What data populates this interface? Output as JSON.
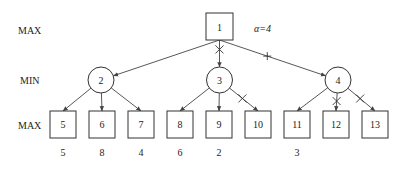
{
  "levels": [
    {
      "id": "level-max-top",
      "label": "MAX"
    },
    {
      "id": "level-min",
      "label": "MIN"
    },
    {
      "id": "level-max-bottom",
      "label": "MAX"
    }
  ],
  "root": {
    "id": "1",
    "label": "1",
    "annotation": "α=4",
    "shape": "square"
  },
  "min_nodes": [
    {
      "id": "2",
      "label": "2",
      "shape": "circle"
    },
    {
      "id": "3",
      "label": "3",
      "shape": "circle"
    },
    {
      "id": "4",
      "label": "4",
      "shape": "circle"
    }
  ],
  "leaves": [
    {
      "id": "5",
      "label": "5",
      "parent": "2",
      "value": "5"
    },
    {
      "id": "6",
      "label": "6",
      "parent": "2",
      "value": "8"
    },
    {
      "id": "7",
      "label": "7",
      "parent": "2",
      "value": "4"
    },
    {
      "id": "8",
      "label": "8",
      "parent": "3",
      "value": "6"
    },
    {
      "id": "9",
      "label": "9",
      "parent": "3",
      "value": "2"
    },
    {
      "id": "10",
      "label": "10",
      "parent": "3",
      "value": ""
    },
    {
      "id": "11",
      "label": "11",
      "parent": "4",
      "value": "3"
    },
    {
      "id": "12",
      "label": "12",
      "parent": "4",
      "value": ""
    },
    {
      "id": "13",
      "label": "13",
      "parent": "4",
      "value": ""
    }
  ],
  "edges": [
    {
      "from": "1",
      "to": "2",
      "mark": "none"
    },
    {
      "from": "1",
      "to": "3",
      "mark": "x"
    },
    {
      "from": "1",
      "to": "4",
      "mark": "plus"
    },
    {
      "from": "2",
      "to": "5",
      "mark": "none"
    },
    {
      "from": "2",
      "to": "6",
      "mark": "none"
    },
    {
      "from": "2",
      "to": "7",
      "mark": "none"
    },
    {
      "from": "3",
      "to": "8",
      "mark": "none"
    },
    {
      "from": "3",
      "to": "9",
      "mark": "none"
    },
    {
      "from": "3",
      "to": "10",
      "mark": "x"
    },
    {
      "from": "4",
      "to": "11",
      "mark": "none"
    },
    {
      "from": "4",
      "to": "12",
      "mark": "x"
    },
    {
      "from": "4",
      "to": "13",
      "mark": "x"
    }
  ]
}
